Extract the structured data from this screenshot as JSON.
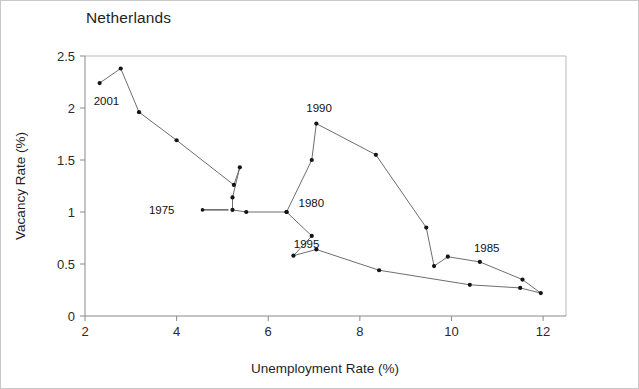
{
  "chart_data": {
    "type": "line",
    "title": "Netherlands",
    "subtitle": "",
    "xlabel": "Unemployment Rate (%)",
    "ylabel": "Vacancy Rate (%)",
    "xlim": [
      2,
      12.5
    ],
    "ylim": [
      0,
      2.5
    ],
    "xticks": [
      2,
      4,
      6,
      8,
      10,
      12
    ],
    "xtick_labels": [
      "2",
      "4",
      "6",
      "8",
      "10",
      "12"
    ],
    "yticks": [
      0,
      0.5,
      1,
      1.5,
      2,
      2.5
    ],
    "ytick_labels": [
      "0",
      "0.5",
      "1",
      "1.5",
      "2",
      "2.5"
    ],
    "grid": false,
    "legend": "none",
    "marker": "filled-circle",
    "series": [
      {
        "name": "Netherlands Beveridge curve (unemployment vs vacancy rate)",
        "points": [
          {
            "x": 2.32,
            "y": 2.24
          },
          {
            "x": 2.78,
            "y": 2.38
          },
          {
            "x": 3.18,
            "y": 1.96
          },
          {
            "x": 4.0,
            "y": 1.69
          },
          {
            "x": 5.25,
            "y": 1.26
          },
          {
            "x": 5.38,
            "y": 1.43
          },
          {
            "x": 5.22,
            "y": 1.14
          },
          {
            "x": 5.22,
            "y": 1.02
          },
          {
            "x": 5.52,
            "y": 1.0
          },
          {
            "x": 6.4,
            "y": 1.0
          },
          {
            "x": 6.95,
            "y": 1.5
          },
          {
            "x": 7.05,
            "y": 1.85
          },
          {
            "x": 8.35,
            "y": 1.55
          },
          {
            "x": 9.45,
            "y": 0.85
          },
          {
            "x": 9.62,
            "y": 0.48
          },
          {
            "x": 9.92,
            "y": 0.57
          },
          {
            "x": 10.62,
            "y": 0.52
          },
          {
            "x": 11.55,
            "y": 0.35
          },
          {
            "x": 11.95,
            "y": 0.22
          },
          {
            "x": 11.5,
            "y": 0.27
          },
          {
            "x": 10.4,
            "y": 0.3
          },
          {
            "x": 8.42,
            "y": 0.44
          },
          {
            "x": 7.05,
            "y": 0.64
          },
          {
            "x": 6.55,
            "y": 0.58
          },
          {
            "x": 6.95,
            "y": 0.77
          },
          {
            "x": 6.4,
            "y": 1.0
          }
        ]
      }
    ],
    "annotations": [
      {
        "label": "2001",
        "x": 2.32,
        "y": 2.24,
        "dx": -6,
        "dy": 22,
        "leader": false
      },
      {
        "label": "1990",
        "x": 7.05,
        "y": 1.85,
        "dx": -10,
        "dy": -12,
        "leader": false
      },
      {
        "label": "1980",
        "x": 6.4,
        "y": 1.0,
        "dx": 12,
        "dy": -5,
        "leader": false
      },
      {
        "label": "1975",
        "x": 5.22,
        "y": 1.02,
        "dx": -58,
        "dy": 4,
        "leader": true
      },
      {
        "label": "1995",
        "x": 6.95,
        "y": 0.77,
        "dx": -18,
        "dy": 12,
        "leader": false
      },
      {
        "label": "1985",
        "x": 10.62,
        "y": 0.52,
        "dx": -6,
        "dy": -10,
        "leader": false
      }
    ]
  },
  "axes": {
    "x_title": "Unemployment Rate (%)",
    "y_title": "Vacancy Rate (%)"
  }
}
